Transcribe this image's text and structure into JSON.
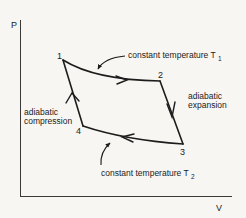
{
  "diagram": {
    "axes": {
      "y_label": "P",
      "x_label": "V"
    },
    "points": [
      {
        "id": "1",
        "label": "1"
      },
      {
        "id": "2",
        "label": "2"
      },
      {
        "id": "3",
        "label": "3"
      },
      {
        "id": "4",
        "label": "4"
      }
    ],
    "annotations": {
      "isotherm_top": {
        "text": "constant temperature T",
        "subscript": "1"
      },
      "isotherm_bottom": {
        "text": "constant temperature T",
        "subscript": "2"
      },
      "adiabatic_expansion": {
        "line1": "adiabatic",
        "line2": "expansion"
      },
      "adiabatic_compression": {
        "line1": "adiabatic",
        "line2": "compression"
      }
    },
    "processes": [
      {
        "from": "1",
        "to": "2",
        "type": "isothermal expansion",
        "temperature": "T1"
      },
      {
        "from": "2",
        "to": "3",
        "type": "adiabatic expansion"
      },
      {
        "from": "3",
        "to": "4",
        "type": "isothermal compression",
        "temperature": "T2"
      },
      {
        "from": "4",
        "to": "1",
        "type": "adiabatic compression"
      }
    ],
    "colors": {
      "background": "#f7f6f3",
      "ink": "#1c1c1c"
    }
  }
}
